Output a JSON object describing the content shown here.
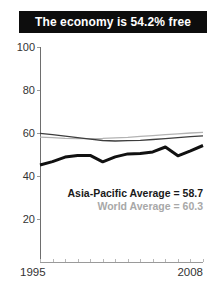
{
  "title_banner": {
    "text": "The economy is 54.2% free",
    "bg_color": "#0d0d0d",
    "text_color": "#ffffff"
  },
  "chart_data": {
    "type": "line",
    "x": [
      1995,
      1996,
      1997,
      1998,
      1999,
      2000,
      2001,
      2002,
      2003,
      2004,
      2005,
      2006,
      2007,
      2008
    ],
    "series": [
      {
        "name": "world-average",
        "label": "World Average",
        "end_value": 60.3,
        "color": "#b3b3b3",
        "width": 1.3,
        "values": [
          58.1,
          57.8,
          57.5,
          57.4,
          57.4,
          57.5,
          57.7,
          58.0,
          58.4,
          58.8,
          59.2,
          59.6,
          60.0,
          60.3
        ]
      },
      {
        "name": "asia-pacific-average",
        "label": "Asia-Pacific Average",
        "end_value": 58.7,
        "color": "#3d3d3d",
        "width": 1.3,
        "values": [
          59.8,
          59.2,
          58.5,
          57.8,
          57.1,
          56.5,
          56.3,
          56.4,
          56.6,
          57.0,
          57.4,
          57.8,
          58.3,
          58.7
        ]
      },
      {
        "name": "country-score",
        "label": "Country score",
        "end_value": 54.2,
        "color": "#111111",
        "width": 3,
        "values": [
          45.1,
          46.7,
          48.8,
          49.6,
          49.6,
          46.6,
          48.9,
          50.3,
          50.4,
          51.2,
          53.5,
          49.4,
          51.7,
          54.2
        ]
      }
    ],
    "ylim": [
      0,
      100
    ],
    "yticks": [
      20,
      40,
      60,
      80,
      100
    ],
    "xtick_labels": [
      "1995",
      "2008"
    ],
    "grid": false,
    "legend_position": "inside-lower-right",
    "annotations": [
      {
        "name": "asia-pacific-legend",
        "text": "Asia-Pacific Average = 58.7",
        "color": "#1a1a1a"
      },
      {
        "name": "world-legend",
        "text": "World Average = 60.3",
        "color": "#a8a8a8"
      }
    ]
  }
}
